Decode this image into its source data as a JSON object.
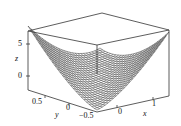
{
  "chart_data": {
    "type": "surface3d",
    "title": "",
    "function_hint": "z ≈ x^2 + x*y style upward bowl/saddle surface rendered as a wireframe mesh",
    "axes": {
      "x": {
        "label": "x",
        "ticks": [
          "0",
          "1"
        ],
        "range": [
          -1,
          1.5
        ]
      },
      "y": {
        "label": "y",
        "ticks": [
          "0.5",
          "0",
          "−0.5"
        ],
        "range": [
          -0.5,
          0.8
        ]
      },
      "z": {
        "label": "z",
        "ticks": [
          "5",
          "0"
        ],
        "range": [
          -3,
          7
        ]
      }
    },
    "box": true,
    "grid": false,
    "legend": null,
    "style": "wireframe mesh, black on white"
  },
  "labels": {
    "z_axis": "z",
    "z_tick_5": "5",
    "z_tick_0": "0",
    "y_axis": "y",
    "y_tick_05": "0.5",
    "y_tick_0": "0",
    "y_tick_m05": "−0.5",
    "x_axis": "x",
    "x_tick_0": "0",
    "x_tick_1": "1"
  }
}
